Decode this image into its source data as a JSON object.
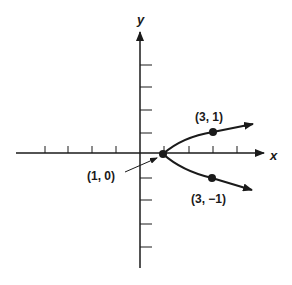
{
  "diagram": {
    "title": "",
    "axes": {
      "x_label": "x",
      "y_label": "y"
    },
    "points": [
      {
        "label": "(1, 0)",
        "x": 1,
        "y": 0
      },
      {
        "label": "(3, 1)",
        "x": 3,
        "y": 1
      },
      {
        "label": "(3, −1)",
        "x": 3,
        "y": -1
      }
    ],
    "curve": "parabola opening right, vertex (1, 0)",
    "colors": {
      "ink": "#1a1a1a",
      "background": "#ffffff"
    }
  }
}
